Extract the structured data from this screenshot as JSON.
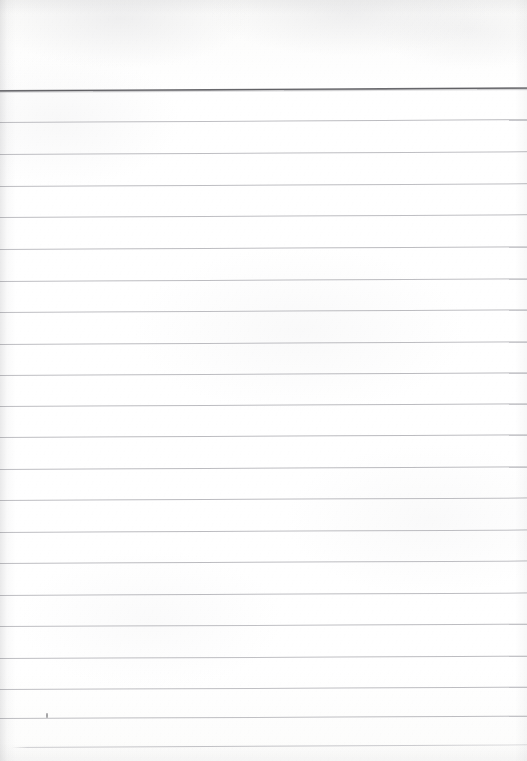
{
  "document": {
    "kind": "lined-notepad-paper-scan",
    "title": "Blank Lined Notepad Page",
    "page_width": 527,
    "page_height": 761,
    "content_text": "",
    "is_blank": true,
    "orientation": "portrait"
  },
  "colors": {
    "paper": "#fdfdfc",
    "paper_highlight": "#ffffff",
    "header_rule": "#606064",
    "body_rule": "#a8a8ad",
    "footer_rule": "#b2b2b7",
    "edge_shadow": "#78787d",
    "speck": "#5a5a5f"
  },
  "layout": {
    "header_margin_height": 89,
    "rule_spacing": 31.9,
    "rule_inset_left": 0,
    "rule_inset_right": 0,
    "skew_degrees": -0.28
  },
  "header_rule": {
    "label": "top heading rule",
    "y": 90,
    "thickness": 2,
    "skew": -0.3
  },
  "body_rules": [
    {
      "index": 1,
      "y": 122,
      "skew": -0.3
    },
    {
      "index": 2,
      "y": 154,
      "skew": -0.29
    },
    {
      "index": 3,
      "y": 186,
      "skew": -0.29
    },
    {
      "index": 4,
      "y": 217,
      "skew": -0.29
    },
    {
      "index": 5,
      "y": 249,
      "skew": -0.28
    },
    {
      "index": 6,
      "y": 281,
      "skew": -0.28
    },
    {
      "index": 7,
      "y": 312,
      "skew": -0.28
    },
    {
      "index": 8,
      "y": 344,
      "skew": -0.28
    },
    {
      "index": 9,
      "y": 375,
      "skew": -0.27
    },
    {
      "index": 10,
      "y": 406,
      "skew": -0.27
    },
    {
      "index": 11,
      "y": 437,
      "skew": -0.27
    },
    {
      "index": 12,
      "y": 469,
      "skew": -0.27
    },
    {
      "index": 13,
      "y": 500,
      "skew": -0.26
    },
    {
      "index": 14,
      "y": 532,
      "skew": -0.26
    },
    {
      "index": 15,
      "y": 563,
      "skew": -0.26
    },
    {
      "index": 16,
      "y": 595,
      "skew": -0.26
    },
    {
      "index": 17,
      "y": 626,
      "skew": -0.25
    },
    {
      "index": 18,
      "y": 658,
      "skew": -0.25
    },
    {
      "index": 19,
      "y": 689,
      "skew": -0.25
    },
    {
      "index": 20,
      "y": 718,
      "skew": -0.25
    }
  ],
  "footer_rule": {
    "label": "faint bottom sheet edge",
    "y": 747,
    "left_inset": 12,
    "skew": -0.3
  },
  "line_slots": [
    {
      "index": 1,
      "top": 91,
      "height": 31,
      "text": ""
    },
    {
      "index": 2,
      "top": 123,
      "height": 31,
      "text": ""
    },
    {
      "index": 3,
      "top": 155,
      "height": 31,
      "text": ""
    },
    {
      "index": 4,
      "top": 187,
      "height": 30,
      "text": ""
    },
    {
      "index": 5,
      "top": 218,
      "height": 31,
      "text": ""
    },
    {
      "index": 6,
      "top": 250,
      "height": 31,
      "text": ""
    },
    {
      "index": 7,
      "top": 282,
      "height": 30,
      "text": ""
    },
    {
      "index": 8,
      "top": 313,
      "height": 31,
      "text": ""
    },
    {
      "index": 9,
      "top": 345,
      "height": 30,
      "text": ""
    },
    {
      "index": 10,
      "top": 376,
      "height": 30,
      "text": ""
    },
    {
      "index": 11,
      "top": 407,
      "height": 30,
      "text": ""
    },
    {
      "index": 12,
      "top": 438,
      "height": 31,
      "text": ""
    },
    {
      "index": 13,
      "top": 470,
      "height": 30,
      "text": ""
    },
    {
      "index": 14,
      "top": 501,
      "height": 31,
      "text": ""
    },
    {
      "index": 15,
      "top": 533,
      "height": 30,
      "text": ""
    },
    {
      "index": 16,
      "top": 564,
      "height": 31,
      "text": ""
    },
    {
      "index": 17,
      "top": 596,
      "height": 30,
      "text": ""
    },
    {
      "index": 18,
      "top": 627,
      "height": 31,
      "text": ""
    },
    {
      "index": 19,
      "top": 659,
      "height": 30,
      "text": ""
    },
    {
      "index": 20,
      "top": 690,
      "height": 28,
      "text": ""
    },
    {
      "index": 21,
      "top": 719,
      "height": 28,
      "text": ""
    }
  ],
  "artifacts": [
    {
      "name": "scan-speck",
      "x": 46,
      "y": 713,
      "width": 2,
      "height": 5
    }
  ]
}
